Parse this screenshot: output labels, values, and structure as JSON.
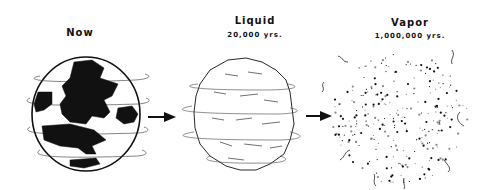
{
  "stages": [
    {
      "id": "now",
      "title": "Now",
      "subtitle": ""
    },
    {
      "id": "liquid",
      "title": "Liquid",
      "subtitle": "20,000 yrs."
    },
    {
      "id": "vapor",
      "title": "Vapor",
      "subtitle": "1,000,000 yrs."
    }
  ],
  "colors": {
    "ink": "#111111",
    "background": "#ffffff"
  }
}
